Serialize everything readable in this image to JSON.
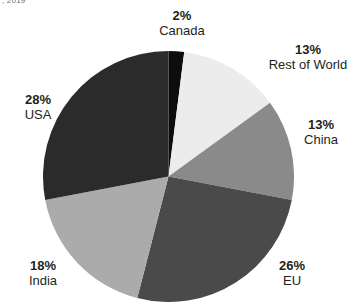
{
  "title_fragment": ", 2019",
  "chart_data": {
    "type": "pie",
    "title": ", 2019",
    "xlabel": "",
    "ylabel": "",
    "legend_position": "none",
    "grid": false,
    "start_angle_deg": 0,
    "direction": "clockwise",
    "categories": [
      "Canada",
      "Rest of World",
      "China",
      "EU",
      "India",
      "USA"
    ],
    "values": [
      2,
      13,
      13,
      26,
      18,
      28
    ],
    "value_unit": "%",
    "total": 100,
    "colors": [
      "#0d0d0d",
      "#ececec",
      "#8a8a8a",
      "#4a4a4a",
      "#ababab",
      "#2b2b2b"
    ],
    "slices": [
      {
        "label": "Canada",
        "value": 2,
        "display_value": "2%",
        "color": "#0d0d0d"
      },
      {
        "label": "Rest of World",
        "value": 13,
        "display_value": "13%",
        "color": "#ececec"
      },
      {
        "label": "China",
        "value": 13,
        "display_value": "13%",
        "color": "#8a8a8a"
      },
      {
        "label": "EU",
        "value": 26,
        "display_value": "26%",
        "color": "#4a4a4a"
      },
      {
        "label": "India",
        "value": 18,
        "display_value": "18%",
        "color": "#ababab"
      },
      {
        "label": "USA",
        "value": 28,
        "display_value": "28%",
        "color": "#2b2b2b"
      }
    ]
  },
  "labels": {
    "canada": {
      "pct": "2%",
      "name": "Canada"
    },
    "rest_of_world": {
      "pct": "13%",
      "name": "Rest of World"
    },
    "china": {
      "pct": "13%",
      "name": "China"
    },
    "eu": {
      "pct": "26%",
      "name": "EU"
    },
    "india": {
      "pct": "18%",
      "name": "India"
    },
    "usa": {
      "pct": "28%",
      "name": "USA"
    }
  },
  "colors": {
    "background": "#ffffff",
    "text": "#231f20",
    "title": "#6d6e71"
  }
}
